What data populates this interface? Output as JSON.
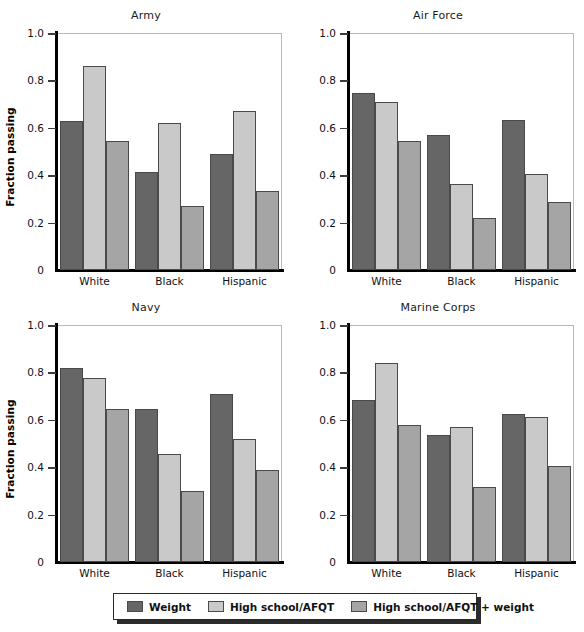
{
  "chart_data": {
    "type": "bar",
    "title": "",
    "xlabel": "",
    "ylabel": "Fraction passing",
    "ylim": [
      0,
      1.0
    ],
    "ytick_labels": [
      "0",
      "0.2",
      "0.4",
      "0.6",
      "0.8",
      "1.0"
    ],
    "ytick_values": [
      0,
      0.2,
      0.4,
      0.6,
      0.8,
      1.0
    ],
    "grid": false,
    "legend_position": "bottom",
    "categories": [
      "White",
      "Black",
      "Hispanic"
    ],
    "series_names": [
      "Weight",
      "High school/AFQT",
      "High school/AFQT + weight"
    ],
    "panels": [
      {
        "title": "Army",
        "series": [
          {
            "name": "Weight",
            "values": [
              0.63,
              0.415,
              0.49
            ]
          },
          {
            "name": "High school/AFQT",
            "values": [
              0.86,
              0.62,
              0.67
            ]
          },
          {
            "name": "High school/AFQT + weight",
            "values": [
              0.545,
              0.27,
              0.335
            ]
          }
        ]
      },
      {
        "title": "Air Force",
        "series": [
          {
            "name": "Weight",
            "values": [
              0.745,
              0.57,
              0.635
            ]
          },
          {
            "name": "High school/AFQT",
            "values": [
              0.71,
              0.365,
              0.405
            ]
          },
          {
            "name": "High school/AFQT + weight",
            "values": [
              0.545,
              0.22,
              0.285
            ]
          }
        ]
      },
      {
        "title": "Navy",
        "series": [
          {
            "name": "Weight",
            "values": [
              0.82,
              0.645,
              0.71
            ]
          },
          {
            "name": "High school/AFQT",
            "values": [
              0.775,
              0.455,
              0.52
            ]
          },
          {
            "name": "High school/AFQT + weight",
            "values": [
              0.645,
              0.3,
              0.39
            ]
          }
        ]
      },
      {
        "title": "Marine Corps",
        "series": [
          {
            "name": "Weight",
            "values": [
              0.685,
              0.535,
              0.625
            ]
          },
          {
            "name": "High school/AFQT",
            "values": [
              0.84,
              0.57,
              0.61
            ]
          },
          {
            "name": "High school/AFQT + weight",
            "values": [
              0.58,
              0.315,
              0.405
            ]
          }
        ]
      }
    ],
    "colors": {
      "series_0": "#666666",
      "series_1": "#c9c9c9",
      "series_2": "#a5a5a5",
      "bar_edge": "#4a4a4a",
      "axis": "#000000",
      "text": "#111111",
      "background": "#ffffff"
    }
  },
  "legend": {
    "items": [
      {
        "label": "Weight",
        "color": "#666666"
      },
      {
        "label": "High school/AFQT",
        "color": "#c9c9c9"
      },
      {
        "label": "High school/AFQT + weight",
        "color": "#a5a5a5"
      }
    ]
  }
}
